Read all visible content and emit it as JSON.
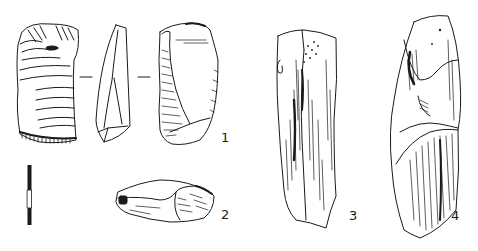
{
  "figure": {
    "type": "archaeological-artifact-plate",
    "background": "#ffffff",
    "ink": "#1a1a1a"
  },
  "labels": [
    {
      "id": "1",
      "text": "1",
      "x": 221,
      "y": 131
    },
    {
      "id": "2",
      "text": "2",
      "x": 221,
      "y": 208
    },
    {
      "id": "3",
      "text": "3",
      "x": 349,
      "y": 209
    },
    {
      "id": "4",
      "text": "4",
      "x": 451,
      "y": 209
    }
  ],
  "scale_bar": {
    "x": 28,
    "y_top": 165,
    "y_bottom": 224,
    "segments": [
      "black",
      "white",
      "black"
    ]
  },
  "artifacts": [
    {
      "id": "1",
      "views": [
        "dorsal",
        "profile",
        "ventral"
      ]
    },
    {
      "id": "2",
      "views": [
        "edge"
      ]
    },
    {
      "id": "3",
      "views": [
        "face"
      ]
    },
    {
      "id": "4",
      "views": [
        "face"
      ]
    }
  ]
}
